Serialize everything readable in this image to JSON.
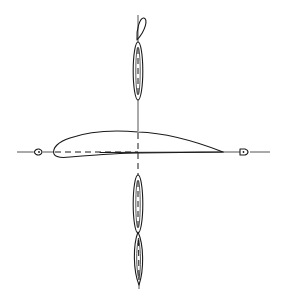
{
  "diagram": {
    "colors": {
      "background": "#ffffff",
      "line": "#1a1a1a"
    },
    "horizontal_axis": {
      "y": 152,
      "x_start": 17,
      "x_end": 270
    },
    "vertical_axis": {
      "x": 138,
      "y_start": 15,
      "y_end": 288
    },
    "airfoil": {
      "leading_edge": [
        53,
        153
      ],
      "trailing_edge": [
        223,
        152
      ],
      "max_thickness_upper_y": 131,
      "max_thickness_x": 110,
      "lower_min_y": 158
    },
    "markers": [
      {
        "name": "left-marker",
        "x": 38,
        "y": 152
      },
      {
        "name": "right-marker",
        "x": 244,
        "y": 152
      }
    ],
    "lobes": [
      {
        "name": "upper-top-lobe",
        "cx": 142,
        "cy": 28,
        "rx": 4,
        "ry": 13
      },
      {
        "name": "upper-main-lobe",
        "cx": 138,
        "cy": 70,
        "rx": 5,
        "ry": 29
      },
      {
        "name": "lower-main-lobe",
        "cx": 138,
        "cy": 204,
        "rx": 5,
        "ry": 29
      },
      {
        "name": "lower-bottom-lobe",
        "cx": 139,
        "cy": 259,
        "rx": 5,
        "ry": 27
      }
    ]
  }
}
